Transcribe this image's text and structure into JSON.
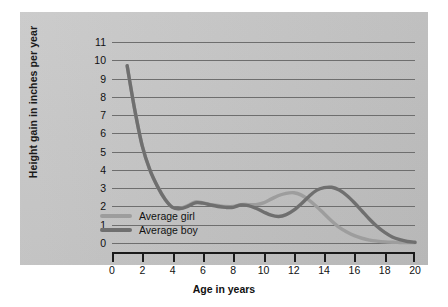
{
  "chart_data": {
    "type": "line",
    "title": "",
    "xlabel": "Age in years",
    "ylabel": "Height gain in inches per year",
    "xlim": [
      0,
      20
    ],
    "ylim": [
      0,
      11
    ],
    "grid": true,
    "legend_position": "inside-lower-left",
    "xticks": [
      "0",
      "2",
      "4",
      "6",
      "8",
      "10",
      "12",
      "14",
      "16",
      "18",
      "20"
    ],
    "yticks": [
      "0",
      "1",
      "2",
      "3",
      "4",
      "5",
      "6",
      "7",
      "8",
      "9",
      "10",
      "11"
    ],
    "series": [
      {
        "name": "Average girl",
        "color": "#9d9d9d",
        "x": [
          1,
          1.5,
          2,
          2.5,
          3,
          3.5,
          4,
          4.5,
          5,
          5.5,
          6,
          6.5,
          7,
          7.5,
          8,
          8.5,
          9,
          9.5,
          10,
          10.5,
          11,
          11.5,
          12,
          12.5,
          13,
          13.5,
          14,
          14.5,
          15,
          15.5,
          16,
          16.5,
          17,
          17.5,
          18,
          18.5,
          19,
          19.5,
          20
        ],
        "values": [
          9.7,
          7.3,
          5.3,
          4.0,
          3.1,
          2.4,
          1.95,
          1.9,
          2.05,
          2.25,
          2.2,
          2.1,
          2.05,
          2.0,
          2.0,
          2.1,
          2.1,
          2.1,
          2.2,
          2.4,
          2.6,
          2.72,
          2.75,
          2.62,
          2.35,
          2.0,
          1.6,
          1.2,
          0.85,
          0.6,
          0.4,
          0.26,
          0.16,
          0.1,
          0.06,
          0.04,
          0.03,
          0.02,
          0.02
        ]
      },
      {
        "name": "Average boy",
        "color": "#6f6f6f",
        "x": [
          1,
          1.5,
          2,
          2.5,
          3,
          3.5,
          4,
          4.5,
          5,
          5.5,
          6,
          6.5,
          7,
          7.5,
          8,
          8.5,
          9,
          9.5,
          10,
          10.5,
          11,
          11.5,
          12,
          12.5,
          13,
          13.5,
          14,
          14.5,
          15,
          15.5,
          16,
          16.5,
          17,
          17.5,
          18,
          18.5,
          19,
          19.5,
          20
        ],
        "values": [
          9.7,
          7.3,
          5.3,
          4.0,
          3.1,
          2.4,
          1.95,
          1.88,
          2.0,
          2.2,
          2.18,
          2.08,
          2.0,
          1.95,
          1.95,
          2.08,
          2.05,
          1.9,
          1.7,
          1.52,
          1.45,
          1.55,
          1.8,
          2.15,
          2.55,
          2.88,
          3.03,
          3.05,
          2.9,
          2.6,
          2.2,
          1.75,
          1.3,
          0.9,
          0.58,
          0.33,
          0.18,
          0.08,
          0.04
        ]
      }
    ],
    "annotations": []
  },
  "axis": {
    "y_title": "Height gain in inches per year",
    "x_title": "Age in years"
  },
  "legend": {
    "items": [
      {
        "label": "Average girl",
        "color": "#9d9d9d"
      },
      {
        "label": "Average boy",
        "color": "#6f6f6f"
      }
    ]
  },
  "colors": {
    "panel_background": "#c2c2c2",
    "gridline": "#6e6e6e",
    "axis": "#1a1a1a",
    "text": "#111111",
    "girl_line": "#9d9d9d",
    "boy_line": "#6f6f6f"
  }
}
